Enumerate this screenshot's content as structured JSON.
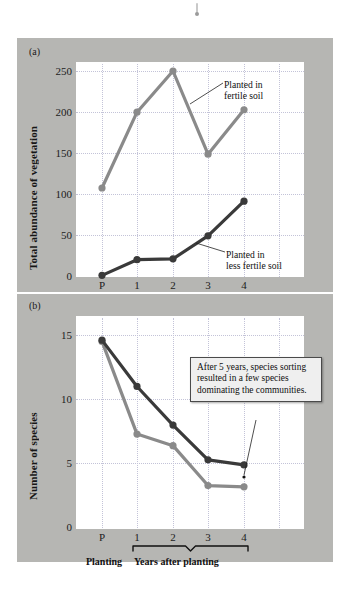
{
  "figure": {
    "background_color": "#b6b6b3",
    "plot_background_color": "#ffffff",
    "series_colors": {
      "fertile": "#8a8a8a",
      "less_fertile": "#3a3a3a"
    },
    "panel_a_label": "(a)",
    "panel_b_label": "(b)",
    "axis_bracket_labels": {
      "planting": "Planting",
      "years_after_planting": "Years after planting"
    }
  },
  "chart_data": [
    {
      "type": "line",
      "panel": "(a)",
      "title": "",
      "xlabel": "",
      "ylabel": "Total abundance of vegetation",
      "x": [
        "P",
        "1",
        "2",
        "3",
        "4"
      ],
      "xticklabels": [
        "P",
        "1",
        "2",
        "3",
        "4"
      ],
      "yticklabels": [
        "0",
        "50",
        "100",
        "150",
        "200",
        "250"
      ],
      "yticks": [
        0,
        50,
        100,
        150,
        200,
        250
      ],
      "ylim": [
        0,
        265
      ],
      "grid": true,
      "legend": "annotations",
      "series": [
        {
          "name": "Planted in fertile soil",
          "color": "#8a8a8a",
          "values": [
            108,
            200,
            250,
            149,
            203
          ]
        },
        {
          "name": "Planted in less fertile soil",
          "color": "#3a3a3a",
          "values": [
            2,
            21,
            22,
            50,
            92
          ]
        }
      ],
      "annotations": [
        {
          "text_line1": "Planted in",
          "text_line2": "fertile soil"
        },
        {
          "text_line1": "Planted in",
          "text_line2": "less fertile soil"
        }
      ]
    },
    {
      "type": "line",
      "panel": "(b)",
      "title": "",
      "xlabel": "",
      "ylabel": "Number of species",
      "x": [
        "P",
        "1",
        "2",
        "3",
        "4"
      ],
      "xticklabels": [
        "P",
        "1",
        "2",
        "3",
        "4"
      ],
      "yticklabels": [
        "0",
        "5",
        "10",
        "15"
      ],
      "yticks": [
        0,
        5,
        10,
        15
      ],
      "ylim": [
        0,
        16.2
      ],
      "grid": true,
      "series": [
        {
          "name": "Planted in fertile soil",
          "color": "#8a8a8a",
          "values": [
            14.5,
            7.3,
            6.4,
            3.3,
            3.2
          ]
        },
        {
          "name": "Planted in less fertile soil",
          "color": "#3a3a3a",
          "values": [
            14.6,
            11.0,
            8.0,
            5.3,
            4.9
          ]
        }
      ],
      "annotations": [
        {
          "text": "After 5 years, species sorting resulted in a few species dominating the communities."
        }
      ]
    }
  ],
  "panel_a": {
    "label": "(a)",
    "y_axis_title": "Total abundance of vegetation",
    "y_ticks": [
      "250",
      "200",
      "150",
      "100",
      "50",
      "0"
    ],
    "x_ticks": [
      "P",
      "1",
      "2",
      "3",
      "4"
    ],
    "annotation_fertile_line1": "Planted in",
    "annotation_fertile_line2": "fertile soil",
    "annotation_less_line1": "Planted in",
    "annotation_less_line2": "less fertile soil"
  },
  "panel_b": {
    "label": "(b)",
    "y_axis_title": "Number of species",
    "y_ticks": [
      "15",
      "10",
      "5",
      "0"
    ],
    "x_ticks": [
      "P",
      "1",
      "2",
      "3",
      "4"
    ],
    "callout_text": "After 5 years, species sorting resulted in a few species dominating the communities.",
    "planting_label": "Planting",
    "years_label": "Years after planting"
  }
}
